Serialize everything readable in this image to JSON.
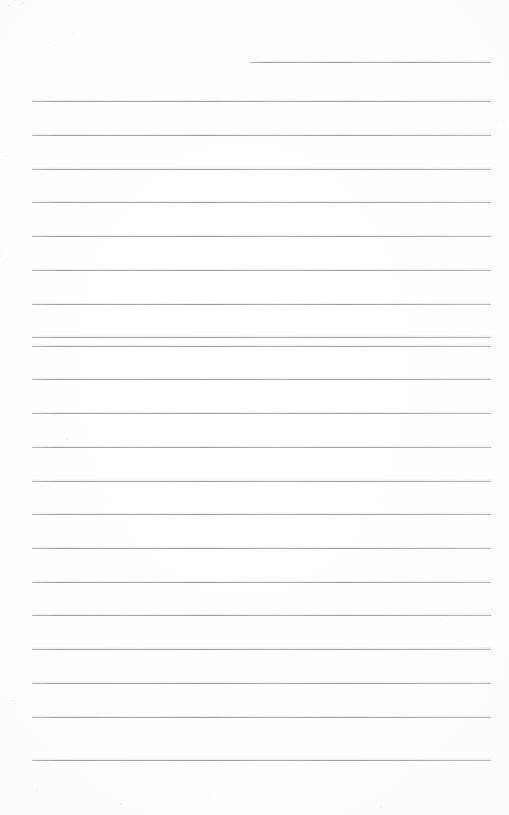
{
  "document": {
    "kind": "lined-paper-scan",
    "title": "",
    "body_text": "",
    "page_width": 509,
    "page_height": 815,
    "background_color": "#fefefe",
    "rule_color": "#a9a9ae",
    "rule_thickness_px": 1,
    "rule_left_px": 32,
    "rule_right_px": 491,
    "rule_spacing_px": 33.6
  },
  "header_rule": {
    "label": "header-rule",
    "left_px": 250,
    "right_px": 491,
    "y_px": 62
  },
  "rules": [
    {
      "label": "rule-1",
      "y_px": 101
    },
    {
      "label": "rule-2",
      "y_px": 135
    },
    {
      "label": "rule-3",
      "y_px": 169
    },
    {
      "label": "rule-4",
      "y_px": 202
    },
    {
      "label": "rule-5",
      "y_px": 236
    },
    {
      "label": "rule-6",
      "y_px": 270
    },
    {
      "label": "rule-7",
      "y_px": 304
    },
    {
      "label": "rule-8",
      "y_px": 337
    },
    {
      "label": "rule-9",
      "y_px": 346
    },
    {
      "label": "rule-10",
      "y_px": 379
    },
    {
      "label": "rule-11",
      "y_px": 413
    },
    {
      "label": "rule-12",
      "y_px": 447
    },
    {
      "label": "rule-13",
      "y_px": 481
    },
    {
      "label": "rule-14",
      "y_px": 514
    },
    {
      "label": "rule-15",
      "y_px": 548
    },
    {
      "label": "rule-16",
      "y_px": 582
    },
    {
      "label": "rule-17",
      "y_px": 615
    },
    {
      "label": "rule-18",
      "y_px": 649
    },
    {
      "label": "rule-19",
      "y_px": 683
    },
    {
      "label": "rule-20",
      "y_px": 717
    },
    {
      "label": "rule-21",
      "y_px": 760
    }
  ],
  "specks": [
    {
      "x": 8,
      "y": 4,
      "s": 3
    },
    {
      "x": 22,
      "y": 2,
      "s": 2
    },
    {
      "x": 53,
      "y": 44,
      "s": 2
    },
    {
      "x": 72,
      "y": 33,
      "s": 1
    },
    {
      "x": 4,
      "y": 155,
      "s": 2
    },
    {
      "x": 2,
      "y": 262,
      "s": 2
    },
    {
      "x": 70,
      "y": 85,
      "s": 1
    },
    {
      "x": 249,
      "y": 59,
      "s": 2
    },
    {
      "x": 66,
      "y": 438,
      "s": 2
    },
    {
      "x": 503,
      "y": 120,
      "s": 2
    },
    {
      "x": 498,
      "y": 330,
      "s": 1
    },
    {
      "x": 12,
      "y": 700,
      "s": 2
    },
    {
      "x": 36,
      "y": 789,
      "s": 2
    },
    {
      "x": 120,
      "y": 803,
      "s": 2
    },
    {
      "x": 210,
      "y": 795,
      "s": 1
    },
    {
      "x": 380,
      "y": 806,
      "s": 2
    },
    {
      "x": 470,
      "y": 780,
      "s": 1
    },
    {
      "x": 300,
      "y": 745,
      "s": 1
    },
    {
      "x": 160,
      "y": 500,
      "s": 1
    },
    {
      "x": 440,
      "y": 620,
      "s": 1
    }
  ]
}
